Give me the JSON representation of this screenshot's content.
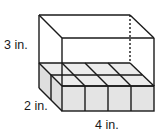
{
  "figure": {
    "type": "rectangular-prism-with-unit-cubes",
    "labels": {
      "height": "3 in.",
      "depth": "2 in.",
      "width": "4 in."
    },
    "dimensions": {
      "length": 4,
      "width": 2,
      "height": 3,
      "unit": "in."
    },
    "cube_layer": {
      "rows": 2,
      "columns": 4,
      "layers": 1,
      "count": 8
    },
    "colors": {
      "stroke": "#1a1a1a",
      "cube_fill": "#e4e4e4",
      "cube_top_fill": "#ececec",
      "background": "#ffffff"
    }
  }
}
